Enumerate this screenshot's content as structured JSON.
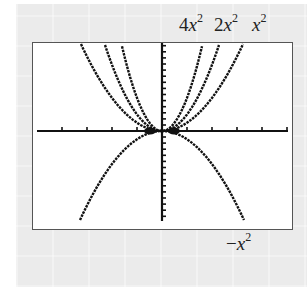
{
  "chart_data": {
    "type": "line",
    "title": "",
    "xlabel": "",
    "ylabel": "",
    "grid": false,
    "legend": "inline labels",
    "xlim": [
      -3.3,
      5.0
    ],
    "ylim": [
      -3.6,
      3.6
    ],
    "x_ticks_spacing": 1,
    "y_ticks_spacing": 0.25,
    "series": [
      {
        "name": "4x^2",
        "label_coef": "4",
        "label_var": "x",
        "label_exp": "2",
        "coef": 4
      },
      {
        "name": "2x^2",
        "label_coef": "2",
        "label_var": "x",
        "label_exp": "2",
        "coef": 2
      },
      {
        "name": "x^2",
        "label_coef": "",
        "label_var": "x",
        "label_exp": "2",
        "coef": 1
      },
      {
        "name": "-x^2",
        "label_coef": "−",
        "label_var": "x",
        "label_exp": "2",
        "coef": -1
      }
    ]
  },
  "labels": {
    "four_x2": {
      "coef": "4",
      "var": "x",
      "exp": "2"
    },
    "two_x2": {
      "coef": "2",
      "var": "x",
      "exp": "2"
    },
    "x2": {
      "coef": "",
      "var": "x",
      "exp": "2"
    },
    "neg_x2": {
      "coef": "−",
      "var": "x",
      "exp": "2"
    }
  },
  "colors": {
    "curve": "#111111",
    "axis": "#111111",
    "frame": "#555555",
    "background": "#ebebeb"
  }
}
